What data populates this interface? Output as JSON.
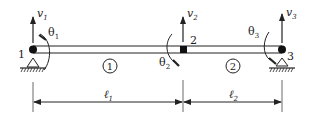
{
  "diagram": {
    "type": "two-element beam",
    "nodes": [
      {
        "id": "1",
        "label": "1",
        "v": "v",
        "v_sub": "1",
        "theta": "θ",
        "theta_sub": "1",
        "support": "pin"
      },
      {
        "id": "2",
        "label": "2",
        "v": "v",
        "v_sub": "2",
        "theta": "θ",
        "theta_sub": "2",
        "support": "none"
      },
      {
        "id": "3",
        "label": "3",
        "v": "v",
        "v_sub": "3",
        "theta": "θ",
        "theta_sub": "3",
        "support": "roller"
      }
    ],
    "elements": [
      {
        "id": "1",
        "label": "1",
        "length": "ℓ",
        "length_sub": "1"
      },
      {
        "id": "2",
        "label": "2",
        "length": "ℓ",
        "length_sub": "2"
      }
    ],
    "colors": {
      "line": "#222222",
      "background": "#ffffff"
    }
  }
}
